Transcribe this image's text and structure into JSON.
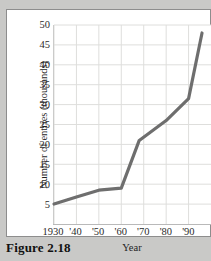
{
  "figure": {
    "caption": "Figure 2.18"
  },
  "chart_data": {
    "type": "line",
    "title": "",
    "xlabel": "Year",
    "ylabel": "Number of entries (thousands)",
    "xlim": [
      1930,
      2000
    ],
    "ylim": [
      0,
      50
    ],
    "grid": true,
    "legend_position": "none",
    "line_color": "#6e6e6e",
    "x_tick_labels": [
      "1930",
      "'40",
      "'50",
      "'60",
      "'70",
      "'80",
      "'90"
    ],
    "x_tick_values": [
      1930,
      1940,
      1950,
      1960,
      1970,
      1980,
      1990
    ],
    "y_tick_labels": [
      "5",
      "10",
      "15",
      "20",
      "25",
      "30",
      "35",
      "40",
      "45",
      "50"
    ],
    "y_tick_values": [
      5,
      10,
      15,
      20,
      25,
      30,
      35,
      40,
      45,
      50
    ],
    "series": [
      {
        "name": "Number of entries",
        "x": [
          1930,
          1940,
          1950,
          1960,
          1968,
          1980,
          1990,
          1996
        ],
        "values": [
          5,
          6.8,
          8.5,
          9,
          21,
          26,
          31.5,
          48
        ]
      }
    ]
  }
}
